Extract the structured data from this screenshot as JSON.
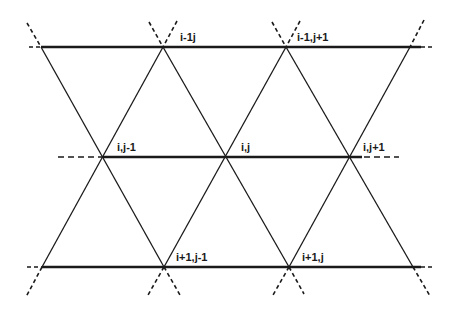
{
  "diagram": {
    "stroke_color": "#1a1a1a",
    "background": "#ffffff",
    "rows": [
      {
        "y": 47,
        "solid": [
          41,
          421
        ],
        "dash_left": [
          29,
          41
        ],
        "dash_right": [
          421,
          433
        ]
      },
      {
        "y": 157,
        "solid": [
          103,
          362
        ],
        "dash_left": [
          58,
          103
        ],
        "dash_right": [
          362,
          398
        ]
      },
      {
        "y": 267,
        "solid": [
          42,
          421
        ],
        "dash_left": [
          27,
          42
        ],
        "dash_right": [
          421,
          432
        ]
      }
    ],
    "labels": [
      {
        "text": "i-1j",
        "x": 180,
        "y": 41
      },
      {
        "text": "i-1,j+1",
        "x": 297,
        "y": 41
      },
      {
        "text": "i,j-1",
        "x": 117,
        "y": 151
      },
      {
        "text": "i,j",
        "x": 241,
        "y": 151
      },
      {
        "text": "i,j+1",
        "x": 363,
        "y": 151
      },
      {
        "text": "i+1,j-1",
        "x": 176,
        "y": 261
      },
      {
        "text": "i+1,j",
        "x": 302,
        "y": 261
      }
    ]
  }
}
